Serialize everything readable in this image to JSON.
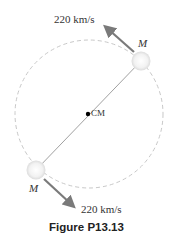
{
  "figure": {
    "caption": "Figure  P13.13",
    "center_of_mass": {
      "label": "CM",
      "x": 88,
      "y": 114
    },
    "orbit": {
      "cx": 89,
      "cy": 114,
      "r": 74,
      "style": "dashed",
      "color": "#c8c8c8"
    },
    "stars": [
      {
        "label": "M",
        "x": 141,
        "y": 61,
        "velocity_label": "220 km/s",
        "velocity_direction": "up-left"
      },
      {
        "label": "M",
        "x": 36,
        "y": 170,
        "velocity_label": "220 km/s",
        "velocity_direction": "down-right"
      }
    ],
    "colors": {
      "arrow": "#7a7a7a",
      "star_fill": "#eeeeee",
      "line": "#888888"
    }
  }
}
